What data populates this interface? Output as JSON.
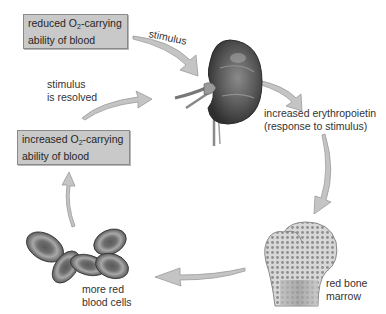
{
  "diagram": {
    "nodes": {
      "reduced_o2": {
        "line1_pre": "reduced O",
        "line1_sub": "2",
        "line1_post": "-carrying",
        "line2": "ability of blood"
      },
      "increased_o2": {
        "line1_pre": "increased O",
        "line1_sub": "2",
        "line1_post": "-carrying",
        "line2": "ability of blood"
      },
      "kidney": {
        "icon": "kidney-illustration"
      },
      "epo": {
        "line1": "increased erythropoietin",
        "line2": "(response to stimulus)"
      },
      "bone": {
        "line1": "red bone",
        "line2": "marrow",
        "icon": "bone-marrow-illustration"
      },
      "cells": {
        "line1": "more red",
        "line2": "blood cells",
        "icon": "red-blood-cells-illustration"
      }
    },
    "edges": {
      "stimulus": "stimulus",
      "resolved_line1": "stimulus",
      "resolved_line2": "is resolved"
    },
    "colors": {
      "box_fill": "#c9c9c9",
      "box_border": "#8a8a8a",
      "arrow_fill": "#bdbdbd",
      "arrow_stroke": "#9a9a9a",
      "illustration_dark": "#3a3a3a",
      "illustration_mid": "#7a7a7a",
      "background": "#ffffff"
    }
  }
}
